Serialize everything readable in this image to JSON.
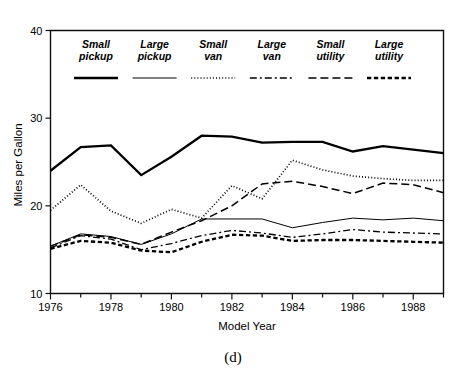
{
  "caption": "(d)",
  "chart_data": {
    "type": "line",
    "title": "",
    "xlabel": "Model Year",
    "ylabel": "Miles per Gallon",
    "x": [
      1976,
      1977,
      1978,
      1979,
      1980,
      1981,
      1982,
      1983,
      1984,
      1985,
      1986,
      1987,
      1988,
      1989
    ],
    "xlim": [
      1976,
      1989
    ],
    "ylim": [
      10,
      40
    ],
    "xticks": [
      1976,
      1977,
      1978,
      1979,
      1980,
      1981,
      1982,
      1983,
      1984,
      1985,
      1986,
      1987,
      1988,
      1989
    ],
    "xticklabels": [
      "1976",
      "",
      "1978",
      "",
      "1980",
      "",
      "1982",
      "",
      "1984",
      "",
      "1986",
      "",
      "1988",
      ""
    ],
    "yticks": [
      10,
      20,
      30,
      40
    ],
    "yticklabels": [
      "10",
      "20",
      "30",
      "40"
    ],
    "grid": false,
    "legend_position": "inside-top",
    "series": [
      {
        "name": "Small\npickup",
        "label_line1": "Small",
        "label_line2": "pickup",
        "style": "solid-thick",
        "dash": "none",
        "width": 2.3,
        "values": [
          24.0,
          26.7,
          26.9,
          23.5,
          25.6,
          28.0,
          27.9,
          27.2,
          27.3,
          27.3,
          26.2,
          26.8,
          26.4,
          26.0
        ]
      },
      {
        "name": "Large\npickup",
        "label_line1": "Large",
        "label_line2": "pickup",
        "style": "solid-thin",
        "dash": "none",
        "width": 1.0,
        "values": [
          15.4,
          16.8,
          16.5,
          15.6,
          16.8,
          18.5,
          18.5,
          18.5,
          17.5,
          18.1,
          18.6,
          18.4,
          18.6,
          18.3
        ]
      },
      {
        "name": "Small\nvan",
        "label_line1": "Small",
        "label_line2": "van",
        "style": "dotted-fine",
        "dash": "1,2.1",
        "width": 1.7,
        "values": [
          19.5,
          22.4,
          19.4,
          18.0,
          19.6,
          18.6,
          22.3,
          20.8,
          25.2,
          24.1,
          23.4,
          23.1,
          22.9,
          22.9
        ]
      },
      {
        "name": "Large\nvan",
        "label_line1": "Large",
        "label_line2": "van",
        "style": "dash-dot",
        "dash": "7,3,2,3",
        "width": 1.3,
        "values": [
          15.2,
          16.6,
          16.2,
          15.0,
          15.7,
          16.6,
          17.2,
          16.9,
          16.4,
          16.8,
          17.3,
          17.0,
          16.9,
          16.8
        ]
      },
      {
        "name": "Small\nutility",
        "label_line1": "Small",
        "label_line2": "utility",
        "style": "dashed-long",
        "dash": "8,4",
        "width": 1.5,
        "values": [
          15.4,
          16.7,
          16.4,
          15.6,
          17.0,
          18.3,
          20.0,
          22.5,
          22.8,
          22.2,
          21.4,
          22.6,
          22.4,
          21.5
        ]
      },
      {
        "name": "Large\nutility",
        "label_line1": "Large",
        "label_line2": "utility",
        "style": "dashed-thick",
        "dash": "4.3,2.6",
        "width": 2.3,
        "values": [
          15.1,
          16.0,
          15.8,
          14.9,
          14.7,
          15.9,
          16.7,
          16.6,
          16.0,
          16.1,
          16.1,
          16.0,
          15.9,
          15.8
        ]
      }
    ]
  }
}
